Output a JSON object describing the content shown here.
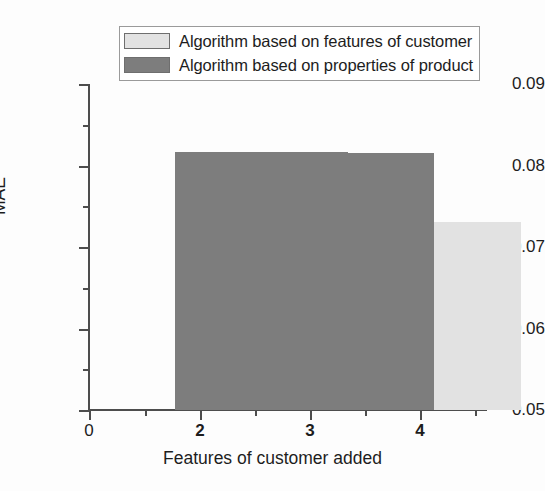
{
  "chart_data": {
    "type": "bar",
    "title": "",
    "subtitle": "",
    "xlabel": "Features of customer added",
    "ylabel": "MAE",
    "categories": [
      "2",
      "3",
      "4"
    ],
    "series": [
      {
        "name": "Algorithm based on  properties of product",
        "color": "#7d7d7d",
        "values": [
          0.0817,
          0.0817,
          0.0815
        ]
      },
      {
        "name": "Algorithm based on features of customer",
        "color": "#e2e2e2",
        "values": [
          0.0769,
          0.0744,
          0.0731
        ]
      }
    ],
    "ylim": [
      0.05,
      0.09
    ],
    "xlim": [
      0,
      4.6
    ],
    "ytick_labels": [
      "0.09",
      "0.08",
      "0.07",
      "0.06",
      "0.05"
    ],
    "ytick_values": [
      0.09,
      0.08,
      0.07,
      0.06,
      0.05
    ],
    "yminor_values": [
      0.085,
      0.075,
      0.065,
      0.055
    ],
    "xtick_labels": [
      "0",
      "2",
      "3",
      "4"
    ],
    "xtick_values": [
      0,
      2,
      3,
      4
    ],
    "xminor_values": [
      1.5,
      2.5,
      3.5,
      4.5
    ],
    "grid": false,
    "legend_position": "top-center"
  },
  "legend": {
    "items": [
      {
        "label": "Algorithm based on features of customer",
        "swatch_color": "#e2e2e2"
      },
      {
        "label": "Algorithm based on  properties of product",
        "swatch_color": "#7d7d7d"
      }
    ]
  },
  "axes": {
    "y": {
      "title": "MAE",
      "ticks": [
        {
          "label": "0.09",
          "top": 84
        },
        {
          "label": "0.08",
          "top": 165.5
        },
        {
          "label": "0.07",
          "top": 247
        },
        {
          "label": "0.06",
          "top": 328.5
        },
        {
          "label": "0.05",
          "top": 410
        }
      ]
    },
    "x": {
      "title": "Features of customer added",
      "ticks": [
        {
          "label": "0",
          "left": 89
        },
        {
          "label": "2",
          "left": 200
        },
        {
          "label": "3",
          "left": 310
        },
        {
          "label": "4",
          "left": 420
        }
      ]
    }
  }
}
